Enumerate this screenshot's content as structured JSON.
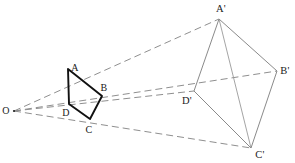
{
  "figure": {
    "kind": "geometry-diagram",
    "canvas": {
      "width": 295,
      "height": 163
    },
    "colors": {
      "background": "#ffffff",
      "source_polygon_stroke": "#111111",
      "image_polygon_stroke": "#8a8a8a",
      "ray_stroke": "#8f8f8f",
      "label_text": "#1a1a1a"
    },
    "strokes": {
      "source_polygon_width": 1.9,
      "image_polygon_width": 1.0,
      "ray_width": 1.0,
      "ray_dash": "7 4"
    },
    "center": {
      "name": "O",
      "label": "O",
      "point": {
        "x": 14,
        "y": 111
      },
      "label_pos": {
        "x": 6,
        "y": 111
      }
    },
    "source_polygon": {
      "name": "ABCD",
      "closed": true,
      "vertices": [
        {
          "name": "A",
          "label": "A",
          "x": 68,
          "y": 69,
          "label_pos": {
            "x": 75,
            "y": 68
          }
        },
        {
          "name": "B",
          "label": "B",
          "x": 102,
          "y": 96,
          "label_pos": {
            "x": 104,
            "y": 88
          }
        },
        {
          "name": "C",
          "label": "C",
          "x": 90,
          "y": 119,
          "label_pos": {
            "x": 89,
            "y": 130
          }
        },
        {
          "name": "D",
          "label": "D",
          "x": 69,
          "y": 104,
          "label_pos": {
            "x": 66,
            "y": 113
          }
        }
      ]
    },
    "image_polygon": {
      "name": "A'B'C'D'",
      "closed": true,
      "vertices": [
        {
          "name": "A'",
          "label": "A'",
          "x": 219,
          "y": 19,
          "label_pos": {
            "x": 221,
            "y": 9
          }
        },
        {
          "name": "B'",
          "label": "B'",
          "x": 277,
          "y": 71,
          "label_pos": {
            "x": 285,
            "y": 71
          }
        },
        {
          "name": "C'",
          "label": "C'",
          "x": 251,
          "y": 148,
          "label_pos": {
            "x": 260,
            "y": 155
          }
        },
        {
          "name": "D'",
          "label": "D'",
          "x": 194,
          "y": 91,
          "label_pos": {
            "x": 187,
            "y": 101
          }
        }
      ]
    },
    "rays": [
      {
        "name": "ray-O-A-Aprime",
        "from": {
          "x": 14,
          "y": 111
        },
        "to": {
          "x": 219,
          "y": 19
        },
        "through": "A"
      },
      {
        "name": "ray-O-B-Bprime",
        "from": {
          "x": 14,
          "y": 111
        },
        "to": {
          "x": 277,
          "y": 71
        },
        "through": "B"
      },
      {
        "name": "ray-O-C-Cprime",
        "from": {
          "x": 14,
          "y": 111
        },
        "to": {
          "x": 251,
          "y": 148
        },
        "through": "C"
      },
      {
        "name": "ray-O-D-Dprime",
        "from": {
          "x": 14,
          "y": 111
        },
        "to": {
          "x": 194,
          "y": 91
        },
        "through": "D"
      }
    ],
    "diagonals": [
      {
        "name": "diagonal-Aprime-Cprime",
        "from": {
          "x": 219,
          "y": 19
        },
        "to": {
          "x": 251,
          "y": 148
        }
      },
      {
        "name": "diagonal-Dprime-Bprime",
        "from": {
          "x": 194,
          "y": 91
        },
        "to": {
          "x": 277,
          "y": 71
        }
      }
    ]
  }
}
